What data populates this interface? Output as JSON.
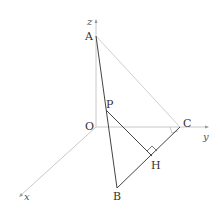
{
  "diagram": {
    "type": "3d-coordinate-geometry",
    "axes": {
      "x": {
        "label": "x"
      },
      "y": {
        "label": "y"
      },
      "z": {
        "label": "z"
      }
    },
    "points": {
      "O": {
        "label": "O"
      },
      "A": {
        "label": "A"
      },
      "B": {
        "label": "B"
      },
      "C": {
        "label": "C"
      },
      "P": {
        "label": "P"
      },
      "H": {
        "label": "H"
      }
    },
    "segments": [
      "AB",
      "BC",
      "AC",
      "PH"
    ],
    "right_angles": [
      "PHC",
      "ACO"
    ],
    "colors": {
      "axis": "#c8c8c8",
      "thin_line": "#d0d0d0",
      "main_line": "#444444"
    }
  }
}
